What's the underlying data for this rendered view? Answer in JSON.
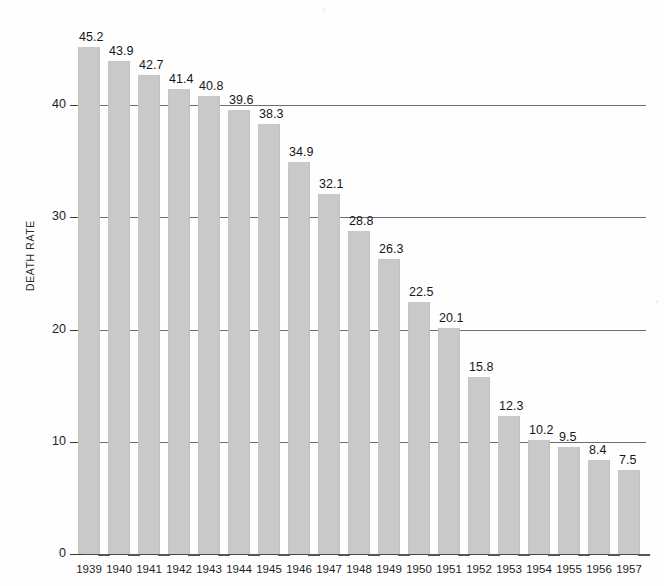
{
  "chart_data": {
    "type": "bar",
    "title": "",
    "xlabel": "",
    "ylabel": "DEATH RATE",
    "categories": [
      "1939",
      "1940",
      "1941",
      "1942",
      "1943",
      "1944",
      "1945",
      "1946",
      "1947",
      "1948",
      "1949",
      "1950",
      "1951",
      "1952",
      "1953",
      "1954",
      "1955",
      "1956",
      "1957"
    ],
    "values": [
      45.2,
      43.9,
      42.7,
      41.4,
      40.8,
      39.6,
      38.3,
      34.9,
      32.1,
      28.8,
      26.3,
      22.5,
      20.1,
      15.8,
      12.3,
      10.2,
      9.5,
      8.4,
      7.5
    ],
    "value_labels": [
      "45.2",
      "43.9",
      "42.7",
      "41.4",
      "40.8",
      "39.6",
      "38.3",
      "34.9",
      "32.1",
      "28.8",
      "26.3",
      "22.5",
      "20.1",
      "15.8",
      "12.3",
      "10.2",
      "9.5",
      "8.4",
      "7.5"
    ],
    "ylim": [
      0,
      48
    ],
    "yticks": [
      0,
      10,
      20,
      30,
      40
    ],
    "ytick_labels": [
      "0",
      "10",
      "20",
      "30",
      "40"
    ],
    "grid": "horizontal-major-only",
    "legend": "none",
    "bar_color": "#c9c9c9",
    "gridline_color": "#6d6d6d",
    "text_color": "#1a1a1a",
    "background_color": "#fefefe"
  },
  "axes": {
    "y_title": "DEATH RATE"
  },
  "footnote": {
    "text": ""
  }
}
